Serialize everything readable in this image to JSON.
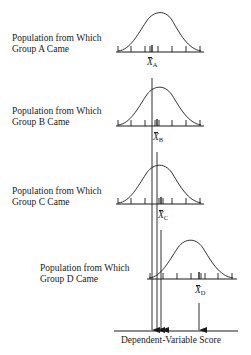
{
  "diagram": {
    "type": "sampling-distribution-comparison",
    "populations": [
      {
        "id": "A",
        "label_line1": "Population from Which",
        "label_line2": "Group A Came",
        "mean_symbol": "X",
        "mean_subscript": "A"
      },
      {
        "id": "B",
        "label_line1": "Population from Which",
        "label_line2": "Group B Came",
        "mean_symbol": "X",
        "mean_subscript": "B"
      },
      {
        "id": "C",
        "label_line1": "Population from Which",
        "label_line2": "Group C Came",
        "mean_symbol": "X",
        "mean_subscript": "C"
      },
      {
        "id": "D",
        "label_line1": "Population from Which",
        "label_line2": "Group D Came",
        "mean_symbol": "X",
        "mean_subscript": "D"
      }
    ],
    "axis_label": "Dependent-Variable Score",
    "colors": {
      "ink": "#1a1a1a",
      "background": "#ffffff"
    }
  }
}
